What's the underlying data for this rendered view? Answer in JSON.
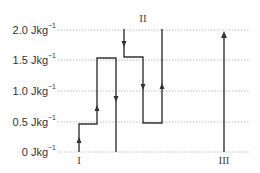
{
  "diagram": {
    "title": "",
    "y_axis": {
      "unit": "Jkg",
      "unit_exponent": "−1",
      "ticks": [
        {
          "value": 2.0,
          "label": "2.0",
          "y": 30
        },
        {
          "value": 1.5,
          "label": "1.5",
          "y": 60
        },
        {
          "value": 1.0,
          "label": "1.0",
          "y": 91
        },
        {
          "value": 0.5,
          "label": "0.5",
          "y": 122
        },
        {
          "value": 0,
          "label": "0",
          "y": 152
        }
      ]
    },
    "paths": [
      {
        "name": "I",
        "label": "I",
        "description": "Starts at 0, steps up to ~0.45, up to ~1.55, then drops to 0",
        "points_value": [
          [
            0,
            0
          ],
          [
            0,
            0.45
          ],
          [
            1,
            0.45
          ],
          [
            1,
            1.55
          ],
          [
            2,
            1.55
          ],
          [
            2,
            0
          ]
        ],
        "arrows": [
          "up",
          "up",
          "down"
        ]
      },
      {
        "name": "II",
        "label": "II",
        "description": "Starts at 2.0, drops to ~1.55, drops to ~0.45, then rises to 2.0",
        "points_value": [
          [
            0,
            2.0
          ],
          [
            0,
            1.55
          ],
          [
            1,
            1.55
          ],
          [
            1,
            0.45
          ],
          [
            2,
            0.45
          ],
          [
            2,
            2.0
          ]
        ],
        "arrows": [
          "down",
          "down",
          "up"
        ]
      },
      {
        "name": "III",
        "label": "III",
        "description": "Single rise from 0 to 2.0",
        "points_value": [
          [
            0,
            0
          ],
          [
            0,
            2.0
          ]
        ],
        "arrows": [
          "up"
        ]
      }
    ],
    "colors": {
      "line": "#333333",
      "grid": "#b8b8b8",
      "text": "#333333"
    }
  }
}
